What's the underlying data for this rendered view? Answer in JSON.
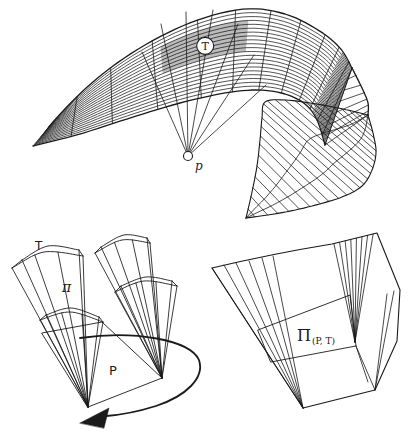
{
  "figure_top": {
    "triangle_label": "T",
    "viewpoint_label": "p"
  },
  "figure_bottom_left": {
    "triangle_label": "T",
    "pyramid_label": "π",
    "polygon_label": "P"
  },
  "figure_bottom_right": {
    "union_label_main": "Π",
    "union_label_sub": "(P, T)"
  },
  "icons": {
    "rotation_arrow": "curved-sweep-arrow"
  },
  "colors": {
    "line": "#1a1a1a",
    "patch_fill": "#bcbcbc",
    "background": "#ffffff"
  }
}
